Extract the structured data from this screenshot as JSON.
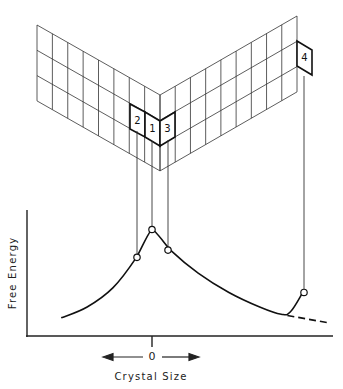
{
  "figure": {
    "cells": [
      {
        "id": "cell-2",
        "label": "2",
        "free_energy_rank": "intermediate, left of peak"
      },
      {
        "id": "cell-1",
        "label": "1",
        "free_energy_rank": "maximum"
      },
      {
        "id": "cell-3",
        "label": "3",
        "free_energy_rank": "intermediate, right of peak"
      },
      {
        "id": "cell-4",
        "label": "4",
        "free_energy_rank": "local point at far right"
      }
    ],
    "x_axis_label": "Crystal Size",
    "y_axis_label": "Free Energy",
    "zero_label": "0"
  },
  "chart_data": {
    "type": "line",
    "title": "",
    "xlabel": "Crystal Size",
    "ylabel": "Free Energy",
    "x_origin_label": "0",
    "grid": false,
    "legend": "none",
    "xlim": [
      -4.0,
      6.0
    ],
    "ylim": [
      0,
      10
    ],
    "series": [
      {
        "name": "free-energy-curve",
        "style": "solid",
        "x": [
          -3.5,
          -2.5,
          -1.5,
          -0.6,
          0.0,
          0.6,
          1.5,
          2.5,
          3.5,
          4.2,
          4.5,
          4.9
        ],
        "y": [
          1.5,
          2.4,
          4.0,
          6.5,
          8.8,
          7.1,
          5.2,
          3.6,
          2.4,
          1.8,
          2.0,
          3.6
        ]
      },
      {
        "name": "extrapolation",
        "style": "dashed",
        "x": [
          4.4,
          5.7
        ],
        "y": [
          1.7,
          1.1
        ]
      }
    ],
    "markers": [
      {
        "label": "2",
        "x": -0.6,
        "y": 6.5
      },
      {
        "label": "1",
        "x": 0.0,
        "y": 8.8
      },
      {
        "label": "3",
        "x": 0.6,
        "y": 7.1
      },
      {
        "label": "4",
        "x": 4.9,
        "y": 3.6
      }
    ]
  }
}
